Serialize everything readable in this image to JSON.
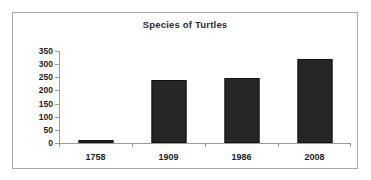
{
  "chart_data": {
    "type": "bar",
    "title": "Species of Turtles",
    "xlabel": "",
    "ylabel": "",
    "categories": [
      "1758",
      "1909",
      "1986",
      "2008"
    ],
    "values": [
      10,
      240,
      248,
      320
    ],
    "ylim": [
      0,
      350
    ],
    "yticks": [
      0,
      50,
      100,
      150,
      200,
      250,
      300,
      350
    ],
    "ytick_labels": [
      "0",
      "50",
      "100",
      "150",
      "200",
      "250",
      "300",
      "350"
    ],
    "grid": false,
    "legend": "none",
    "bar_color": "#262626",
    "border_color": "#a8a8a8",
    "axis_color": "#9a9a9a",
    "text_color": "#1d1d1d",
    "background": "#ffffff"
  }
}
